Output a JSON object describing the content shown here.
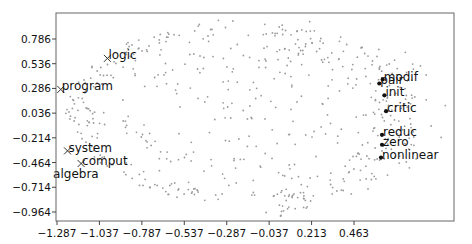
{
  "chart_data": {
    "type": "scatter",
    "title": "",
    "xlabel": "",
    "ylabel": "",
    "xlim": [
      -1.3,
      1.03
    ],
    "ylim": [
      -1.055,
      1.05
    ],
    "grid": false,
    "legend": null,
    "xticks": [
      -1.287,
      -1.037,
      -0.787,
      -0.537,
      -0.287,
      -0.037,
      0.213,
      0.463
    ],
    "xtick_labels": [
      "−1.287",
      "−1.037",
      "−0.787",
      "−0.537",
      "−0.287",
      "−0.037",
      "0.213",
      "0.463"
    ],
    "yticks": [
      0.786,
      0.536,
      0.286,
      0.036,
      -0.214,
      -0.464,
      -0.714,
      -0.964
    ],
    "ytick_labels": [
      "0.786",
      "0.536",
      "0.286",
      "0.036",
      "−0.214",
      "−0.464",
      "−0.714",
      "−0.964"
    ],
    "background_points": {
      "color": "#9a9a9a",
      "marker": "dot",
      "description": "several hundred small gray points forming a wide oval; dense crescent near the left edge and a dense cluster near the right edge"
    },
    "labeled_points": [
      {
        "label": "logic",
        "x": -0.99,
        "y": 0.59,
        "marker": "x",
        "color": "#333333"
      },
      {
        "label": "program",
        "x": -1.265,
        "y": 0.276,
        "marker": "x",
        "color": "#333333"
      },
      {
        "label": "system",
        "x": -1.225,
        "y": -0.346,
        "marker": "x",
        "color": "#333333"
      },
      {
        "label": "comput",
        "x": -1.145,
        "y": -0.474,
        "marker": "x",
        "color": "#333333"
      },
      {
        "label": "algebra",
        "x": -1.145,
        "y": -0.474,
        "marker": "none",
        "color": "#333333",
        "label_offset": "below-left"
      },
      {
        "label": "modif",
        "x": 0.632,
        "y": 0.376,
        "marker": "dot",
        "color": "#111111"
      },
      {
        "label": "pair",
        "x": 0.612,
        "y": 0.336,
        "marker": "dot",
        "color": "#111111"
      },
      {
        "label": "init",
        "x": 0.642,
        "y": 0.216,
        "marker": "dot",
        "color": "#111111"
      },
      {
        "label": "critic",
        "x": 0.652,
        "y": 0.056,
        "marker": "dot",
        "color": "#111111"
      },
      {
        "label": "reduc",
        "x": 0.628,
        "y": -0.184,
        "marker": "dot",
        "color": "#111111"
      },
      {
        "label": "zero",
        "x": 0.628,
        "y": -0.284,
        "marker": "dot",
        "color": "#111111"
      },
      {
        "label": "nonlinear",
        "x": 0.622,
        "y": -0.414,
        "marker": "dot",
        "color": "#111111"
      }
    ]
  }
}
